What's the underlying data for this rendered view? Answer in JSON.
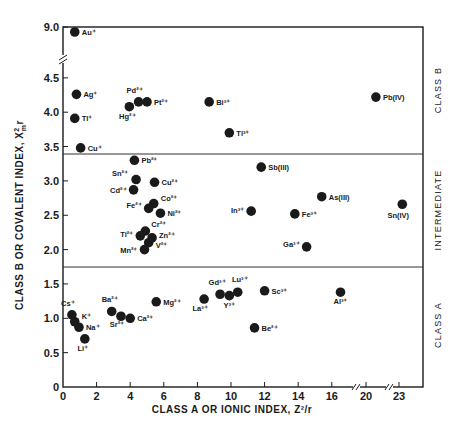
{
  "chart_data": {
    "type": "scatter",
    "title": "",
    "xlabel": "CLASS A  OR  IONIC  INDEX, Z²/r",
    "ylabel": "CLASS B  OR  COVALENT  INDEX, X²ₘr",
    "x_ticks": [
      "0",
      "2",
      "4",
      "6",
      "8",
      "10",
      "12",
      "14",
      "16",
      "20",
      "23"
    ],
    "y_ticks": [
      "0",
      "0.5",
      "1.0",
      "1.5",
      "2.0",
      "2.5",
      "3.0",
      "3.5",
      "4.0",
      "4.5",
      "9.0"
    ],
    "x_axis_breaks": [
      "between 16 and 20",
      "between 20 and 23"
    ],
    "y_axis_breaks": [
      "between 4.5 and 9.0"
    ],
    "regions": [
      {
        "name": "CLASS B",
        "y_range": [
          3.4,
          9.0
        ]
      },
      {
        "name": "INTERMEDIATE",
        "y_range": [
          1.75,
          3.4
        ]
      },
      {
        "name": "CLASS A",
        "y_range": [
          0,
          1.75
        ]
      }
    ],
    "grid": false,
    "legend": "none",
    "points": [
      {
        "label": "Au⁺",
        "x": 0.7,
        "y": 8.8
      },
      {
        "label": "Ag⁺",
        "x": 0.8,
        "y": 4.26
      },
      {
        "label": "Tl⁺",
        "x": 0.7,
        "y": 3.91
      },
      {
        "label": "Cu⁺",
        "x": 1.05,
        "y": 3.48
      },
      {
        "label": "Hg²⁺",
        "x": 3.95,
        "y": 4.08
      },
      {
        "label": "Pd²⁺",
        "x": 4.5,
        "y": 4.15
      },
      {
        "label": "Pt²⁺",
        "x": 5.0,
        "y": 4.15
      },
      {
        "label": "Bi³⁺",
        "x": 8.7,
        "y": 4.15
      },
      {
        "label": "Tl³⁺",
        "x": 9.9,
        "y": 3.7
      },
      {
        "label": "Pb(IV)",
        "x": 20.9,
        "y": 4.22
      },
      {
        "label": "Pb²⁺",
        "x": 4.25,
        "y": 3.3
      },
      {
        "label": "Sn²⁺",
        "x": 4.35,
        "y": 3.02
      },
      {
        "label": "Cu²⁺",
        "x": 5.45,
        "y": 2.98
      },
      {
        "label": "Cd²⁺",
        "x": 4.2,
        "y": 2.87
      },
      {
        "label": "Co²⁺",
        "x": 5.4,
        "y": 2.67
      },
      {
        "label": "Fe²⁺",
        "x": 5.1,
        "y": 2.6
      },
      {
        "label": "Ni²⁺",
        "x": 5.8,
        "y": 2.53
      },
      {
        "label": "Cr²⁺",
        "x": 4.9,
        "y": 2.27
      },
      {
        "label": "Ti²⁺",
        "x": 4.6,
        "y": 2.2
      },
      {
        "label": "Zn²⁺",
        "x": 5.3,
        "y": 2.17
      },
      {
        "label": "V²⁺",
        "x": 5.1,
        "y": 2.1
      },
      {
        "label": "Mn²⁺",
        "x": 4.85,
        "y": 2.0
      },
      {
        "label": "Sb(III)",
        "x": 11.8,
        "y": 3.2
      },
      {
        "label": "As(III)",
        "x": 15.4,
        "y": 2.77
      },
      {
        "label": "In³⁺",
        "x": 11.2,
        "y": 2.56
      },
      {
        "label": "Fe³⁺",
        "x": 13.8,
        "y": 2.52
      },
      {
        "label": "Ga³⁺",
        "x": 14.5,
        "y": 2.04
      },
      {
        "label": "Sn(IV)",
        "x": 23.3,
        "y": 2.66
      },
      {
        "label": "Cs⁺",
        "x": 0.53,
        "y": 1.05
      },
      {
        "label": "K⁺",
        "x": 0.7,
        "y": 0.95
      },
      {
        "label": "Na⁺",
        "x": 0.95,
        "y": 0.87
      },
      {
        "label": "Li⁺",
        "x": 1.3,
        "y": 0.7
      },
      {
        "label": "Ba²⁺",
        "x": 2.9,
        "y": 1.1
      },
      {
        "label": "Sr²⁺",
        "x": 3.45,
        "y": 1.03
      },
      {
        "label": "Ca²⁺",
        "x": 4.0,
        "y": 1.0
      },
      {
        "label": "Mg²⁺",
        "x": 5.55,
        "y": 1.24
      },
      {
        "label": "La³⁺",
        "x": 8.4,
        "y": 1.28
      },
      {
        "label": "Gd³⁺",
        "x": 9.35,
        "y": 1.35
      },
      {
        "label": "Y³⁺",
        "x": 9.9,
        "y": 1.33
      },
      {
        "label": "Lu³⁺",
        "x": 10.4,
        "y": 1.38
      },
      {
        "label": "Sc³⁺",
        "x": 12.0,
        "y": 1.4
      },
      {
        "label": "Be²⁺",
        "x": 11.4,
        "y": 0.86
      },
      {
        "label": "Al³⁺",
        "x": 17.0,
        "y": 1.38
      }
    ]
  },
  "labels": {
    "xlabel": "CLASS A  OR  IONIC  INDEX, Z²/r",
    "ylabel_main": "CLASS B  OR  COVALENT  INDEX, X",
    "ylabel_sup": "2",
    "ylabel_sub": "m",
    "ylabel_tail": "r",
    "region_b": "CLASS B",
    "region_int": "INTERMEDIATE",
    "region_a": "CLASS A"
  }
}
